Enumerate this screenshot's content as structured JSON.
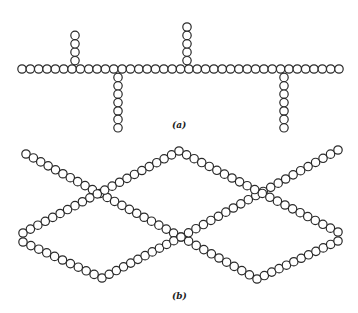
{
  "figure": {
    "panel_a": {
      "label": "(a)",
      "description": "Branched chain",
      "main_chain": {
        "x_start": 22,
        "x_end": 339,
        "y": 69
      },
      "branches": [
        {
          "x": 75,
          "direction": "up",
          "beads": 4
        },
        {
          "x": 118,
          "direction": "down",
          "beads": 7
        },
        {
          "x": 187,
          "direction": "up",
          "beads": 5
        },
        {
          "x": 284,
          "direction": "down",
          "beads": 7
        }
      ]
    },
    "panel_b": {
      "label": "(b)",
      "description": "Cross-linked chains",
      "paths": [
        [
          [
            26,
            154
          ],
          [
            181,
            237
          ],
          [
            257,
            279
          ],
          [
            338,
            241
          ]
        ],
        [
          [
            23,
            242
          ],
          [
            102,
            278
          ],
          [
            181,
            237
          ],
          [
            338,
            150
          ]
        ],
        [
          [
            23,
            233
          ],
          [
            179,
            151
          ],
          [
            338,
            232
          ]
        ]
      ]
    },
    "bead_radius": 4.2,
    "bead_color": "#2a2a2a"
  }
}
